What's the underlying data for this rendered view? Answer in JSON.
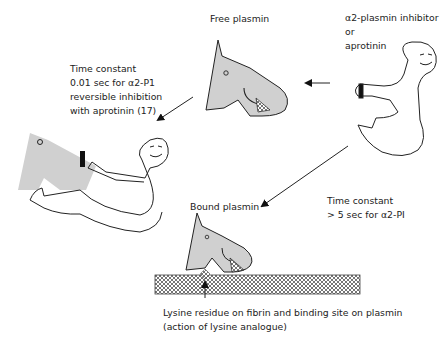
{
  "labels": {
    "free_plasmin": "Free plasmin",
    "inhibitor": [
      "α2-plasmin inhibitor",
      "or",
      "aprotinin"
    ],
    "fast_complex": [
      "Time constant",
      "0.01 sec for α2-P1",
      "reversible inhibition",
      "with aprotinin (17)"
    ],
    "slow_binding": [
      "Time constant",
      "> 5 sec for α2-PI"
    ],
    "bound_plasmin": "Bound plasmin",
    "lysine_site": [
      "Lysine residue on fibrin and binding site on plasmin",
      "(action of lysine analogue)"
    ]
  },
  "colors": {
    "plasmin_fill": "#d0d0d0",
    "outline": "#222222",
    "fibrin_pattern": "#777777"
  }
}
